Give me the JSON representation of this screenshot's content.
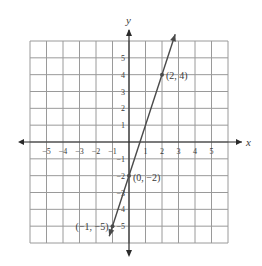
{
  "chart_data": {
    "type": "line",
    "title": "",
    "xlabel": "x",
    "ylabel": "y",
    "xlim": [
      -6,
      6
    ],
    "ylim": [
      -6,
      6
    ],
    "grid": true,
    "x_ticks": [
      -5,
      -4,
      -3,
      -2,
      -1,
      1,
      2,
      3,
      4,
      5
    ],
    "y_ticks": [
      -5,
      -4,
      -3,
      -2,
      -1,
      1,
      2,
      3,
      4,
      5
    ],
    "x_tick_labels": [
      "−5",
      "−4",
      "−3",
      "−2",
      "−1",
      "1",
      "2",
      "3",
      "4",
      "5"
    ],
    "y_tick_labels": [
      "−5",
      "−4",
      "−3",
      "−2",
      "−1",
      "1",
      "2",
      "3",
      "4",
      "5"
    ],
    "series": [
      {
        "name": "y = 3x − 2",
        "slope": 3,
        "intercept": -2,
        "x": [
          -1.2,
          2.8
        ],
        "y": [
          -5.6,
          6.4
        ]
      }
    ],
    "points": [
      {
        "x": 2,
        "y": 4,
        "label": "(2, 4)"
      },
      {
        "x": 0,
        "y": -2,
        "label": "(0, −2)"
      },
      {
        "x": -1,
        "y": -5,
        "label": "(−1, −5)"
      }
    ],
    "colors": {
      "line": "#4a4a4a",
      "grid": "#9a9a9a",
      "axis": "#2a2a2a",
      "text": "#3a3a3a"
    }
  }
}
